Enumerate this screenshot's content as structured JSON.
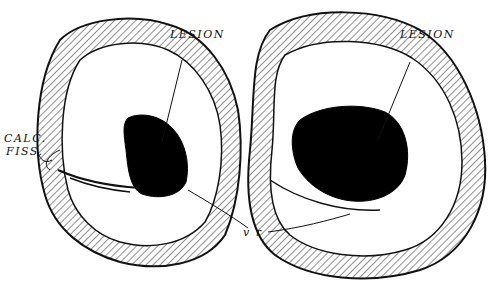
{
  "figure": {
    "labels": {
      "lesion_left": "LESION",
      "lesion_right": "LESION",
      "calc_line1": "CALC.",
      "calc_line2": "FISS.",
      "vr": "v r"
    },
    "colors": {
      "ink": "#111111",
      "paper": "#ffffff",
      "lesion": "#000000"
    }
  }
}
